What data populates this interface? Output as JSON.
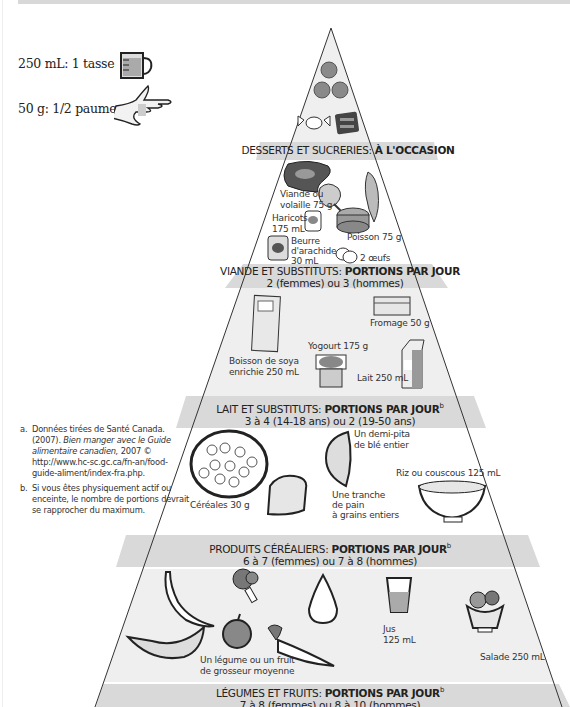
{
  "legend": {
    "cup": {
      "text": "250 mL: 1 tasse",
      "icon": "measuring-cup-icon"
    },
    "palm": {
      "text": "50 g: 1/2 paume",
      "icon": "hand-palm-icon"
    }
  },
  "tiers": [
    {
      "id": "desserts",
      "title_normal": "DESSERTS ET SUCRERIES:",
      "title_bold": "À L'OCCASION",
      "superscript": "",
      "subtitle": "",
      "items": [
        {
          "icon": "cookie-icon",
          "label": ""
        },
        {
          "icon": "candy-icon",
          "label": ""
        },
        {
          "icon": "chocolate-bar-icon",
          "label": ""
        }
      ]
    },
    {
      "id": "viande",
      "title_normal": "VIANDE ET SUBSTITUTS:",
      "title_bold": "PORTIONS PAR JOUR",
      "superscript": "",
      "subtitle": "2 (femmes) ou 3 (hommes)",
      "items": [
        {
          "icon": "steak-icon",
          "label": ""
        },
        {
          "icon": "chicken-leg-icon",
          "label_line1": "Viande ou",
          "label_line2": "volaille 75 g"
        },
        {
          "icon": "fish-icon",
          "label": ""
        },
        {
          "icon": "bean-can-icon",
          "label_line1": "Haricots",
          "label_line2": "175 mL"
        },
        {
          "icon": "tuna-can-icon",
          "label": "Poisson 75 g"
        },
        {
          "icon": "peanut-butter-jar-icon",
          "label_line1": "Beurre",
          "label_line2": "d'arachide",
          "label_line3": "30 mL"
        },
        {
          "icon": "eggs-icon",
          "label": "2 œufs"
        }
      ]
    },
    {
      "id": "lait",
      "title_normal": "LAIT ET SUBSTITUTS:",
      "title_bold": "PORTIONS PAR JOUR",
      "superscript": "b",
      "subtitle": "3 à 4 (14-18 ans) ou 2 (19-50 ans)",
      "items": [
        {
          "icon": "soy-drink-carton-icon",
          "label_line1": "Boisson de soya",
          "label_line2": "enrichie 250 mL"
        },
        {
          "icon": "cheese-icon",
          "label": "Fromage 50 g"
        },
        {
          "icon": "yogurt-icon",
          "label": "Yogourt 175 g"
        },
        {
          "icon": "milk-carton-icon",
          "label": "Lait 250 mL"
        }
      ]
    },
    {
      "id": "cereales",
      "title_normal": "PRODUITS CÉRÉALIERS:",
      "title_bold": "PORTIONS PAR JOUR",
      "superscript": "b",
      "subtitle": "6 à 7 (femmes) ou 7 à 8 (hommes)",
      "items": [
        {
          "icon": "cereal-bowl-icon",
          "label": "Céréales 30 g"
        },
        {
          "icon": "pita-icon",
          "label_line1": "Un demi-pita",
          "label_line2": "de blé entier"
        },
        {
          "icon": "bread-slice-icon",
          "label_line1": "Une tranche",
          "label_line2": "de pain",
          "label_line3": "à grains entiers"
        },
        {
          "icon": "rice-bowl-icon",
          "label": "Riz ou couscous 125 mL"
        }
      ]
    },
    {
      "id": "legumes",
      "title_normal": "LÉGUMES ET FRUITS:",
      "title_bold": "PORTIONS PAR JOUR",
      "superscript": "b",
      "subtitle": "7 à 8 (femmes) ou 8 à 10 (hommes)",
      "items": [
        {
          "icon": "banana-icon",
          "label": ""
        },
        {
          "icon": "broccoli-icon",
          "label": ""
        },
        {
          "icon": "pear-icon",
          "label": ""
        },
        {
          "icon": "juice-glass-icon",
          "label_line1": "Jus",
          "label_line2": "125 mL"
        },
        {
          "icon": "salad-bowl-icon",
          "label": "Salade 250 mL"
        },
        {
          "icon": "melon-slice-icon",
          "label": ""
        },
        {
          "icon": "orange-icon",
          "label_line1": "Un légume ou un fruit",
          "label_line2": "de grosseur moyenne"
        },
        {
          "icon": "carrot-icon",
          "label": ""
        }
      ]
    }
  ],
  "footnotes": [
    {
      "key": "a.",
      "text_before": "Données tirées de Santé Canada. (2007). ",
      "text_italic": "Bien manger avec le Guide alimentaire canadien,",
      "text_after": " 2007 © http://www.hc-sc.gc.ca/fn-an/food-guide-aliment/index-fra.php."
    },
    {
      "key": "b.",
      "text_before": "Si vous êtes physiquement actif ou enceinte, le nombre de portions devrait se rapprocher du maximum.",
      "text_italic": "",
      "text_after": ""
    }
  ],
  "colors": {
    "band": "#d9d9d9",
    "tier_fill": "#ececec",
    "outline": "#333333"
  }
}
